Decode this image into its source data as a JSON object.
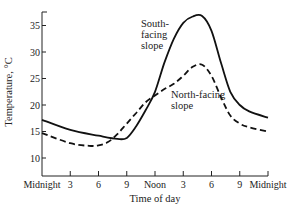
{
  "chart_data": {
    "type": "line",
    "title": "",
    "xlabel": "Time of day",
    "ylabel": "Temperature, °C",
    "x_ticks": [
      {
        "hour": 0,
        "label": "Midnight"
      },
      {
        "hour": 3,
        "label": "3"
      },
      {
        "hour": 6,
        "label": "6"
      },
      {
        "hour": 9,
        "label": "9"
      },
      {
        "hour": 12,
        "label": "Noon"
      },
      {
        "hour": 15,
        "label": "3"
      },
      {
        "hour": 18,
        "label": "6"
      },
      {
        "hour": 21,
        "label": "9"
      },
      {
        "hour": 24,
        "label": "Midnight"
      }
    ],
    "y_ticks": [
      10,
      15,
      20,
      25,
      30,
      35
    ],
    "xlim": [
      0,
      24
    ],
    "ylim": [
      6.6,
      37.5
    ],
    "grid": false,
    "legend": "none (inline annotations)",
    "series": [
      {
        "name": "South-facing slope",
        "style": "solid",
        "label_lines": [
          "South-",
          "facing",
          "slope"
        ],
        "x": [
          0,
          3,
          6,
          8,
          9,
          10,
          11,
          12,
          13,
          14,
          15,
          16,
          17,
          18,
          19,
          20,
          21,
          22,
          24
        ],
        "values": [
          17.2,
          15.3,
          14.2,
          13.6,
          13.8,
          16,
          19,
          22.5,
          28,
          32.5,
          35.5,
          36.7,
          36.8,
          34,
          28,
          22.5,
          20,
          18.8,
          17.6
        ]
      },
      {
        "name": "North-facing slope",
        "style": "dashed",
        "label_lines": [
          "North-facing",
          "slope"
        ],
        "x": [
          0,
          3,
          5,
          6,
          7,
          8,
          9,
          10,
          11,
          12,
          13,
          14,
          15,
          16,
          17,
          18,
          19,
          20,
          21,
          22,
          24
        ],
        "values": [
          14.7,
          12.8,
          12.3,
          12.4,
          13,
          14.5,
          16.5,
          18.5,
          20.5,
          21.8,
          23,
          24,
          25.5,
          27.2,
          27.6,
          25.5,
          21.5,
          18,
          16.5,
          15.8,
          15
        ]
      }
    ]
  }
}
